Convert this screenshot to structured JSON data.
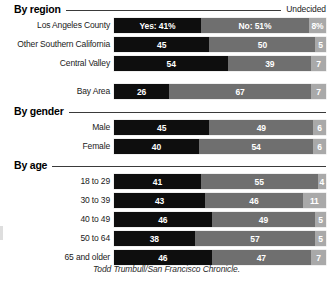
{
  "undecided_label": "Undecided",
  "credit": "Todd Trumbull/San Francisco Chronicle.",
  "colors": {
    "yes": "#0e0e0e",
    "no": "#6f6f6f",
    "undecided": "#a9a9a9",
    "background": "#ffffff",
    "rule": "#3a3a3a"
  },
  "sections": [
    {
      "title": "By region"
    },
    {
      "title": "By gender"
    },
    {
      "title": "By age"
    }
  ],
  "chart_data": {
    "type": "bar",
    "title": "",
    "subtitle": "",
    "xlabel": "",
    "ylabel": "",
    "orientation": "horizontal",
    "stacked": true,
    "stack_total": 100,
    "xlim": [
      0,
      100
    ],
    "grid": false,
    "legend_position": "top-right",
    "series": [
      {
        "name": "Yes",
        "label_first_row": "Yes: 41%"
      },
      {
        "name": "No",
        "label_first_row": "No: 51%"
      },
      {
        "name": "Undecided",
        "label_first_row": "8%"
      }
    ],
    "groups": [
      {
        "title": "By region",
        "categories": [
          "Los Angeles County",
          "Other Southern California",
          "Central Valley",
          "Bay Area"
        ],
        "rows": [
          {
            "category": "Los Angeles County",
            "yes": 41,
            "no": 51,
            "undecided": 8,
            "yes_label": "Yes: 41%",
            "no_label": "No: 51%",
            "undecided_label": "8%"
          },
          {
            "category": "Other Southern California",
            "yes": 45,
            "no": 50,
            "undecided": 5,
            "yes_label": "45",
            "no_label": "50",
            "undecided_label": "5"
          },
          {
            "category": "Central Valley",
            "yes": 54,
            "no": 39,
            "undecided": 7,
            "yes_label": "54",
            "no_label": "39",
            "undecided_label": "7"
          },
          {
            "category": "Bay Area",
            "yes": 26,
            "no": 67,
            "undecided": 7,
            "yes_label": "26",
            "no_label": "67",
            "undecided_label": "7"
          }
        ]
      },
      {
        "title": "By gender",
        "categories": [
          "Male",
          "Female"
        ],
        "rows": [
          {
            "category": "Male",
            "yes": 45,
            "no": 49,
            "undecided": 6,
            "yes_label": "45",
            "no_label": "49",
            "undecided_label": "6"
          },
          {
            "category": "Female",
            "yes": 40,
            "no": 54,
            "undecided": 6,
            "yes_label": "40",
            "no_label": "54",
            "undecided_label": "6"
          }
        ]
      },
      {
        "title": "By age",
        "categories": [
          "18 to 29",
          "30 to 39",
          "40 to 49",
          "50 to 64",
          "65 and older"
        ],
        "rows": [
          {
            "category": "18 to 29",
            "yes": 41,
            "no": 55,
            "undecided": 4,
            "yes_label": "41",
            "no_label": "55",
            "undecided_label": "4"
          },
          {
            "category": "30 to 39",
            "yes": 43,
            "no": 46,
            "undecided": 11,
            "yes_label": "43",
            "no_label": "46",
            "undecided_label": "11"
          },
          {
            "category": "40 to 49",
            "yes": 46,
            "no": 49,
            "undecided": 5,
            "yes_label": "46",
            "no_label": "49",
            "undecided_label": "5"
          },
          {
            "category": "50 to 64",
            "yes": 38,
            "no": 57,
            "undecided": 5,
            "yes_label": "38",
            "no_label": "57",
            "undecided_label": "5"
          },
          {
            "category": "65 and older",
            "yes": 46,
            "no": 47,
            "undecided": 7,
            "yes_label": "46",
            "no_label": "47",
            "undecided_label": "7"
          }
        ]
      }
    ]
  }
}
